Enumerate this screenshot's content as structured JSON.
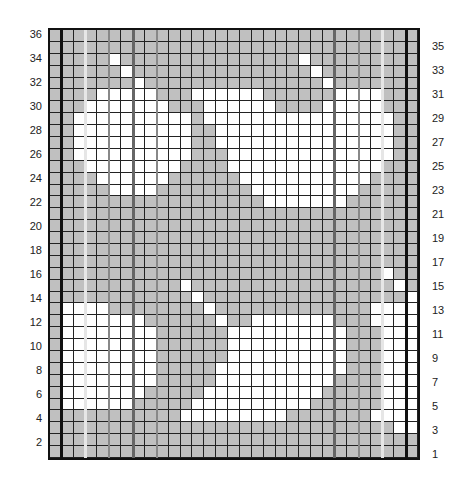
{
  "chart": {
    "rows": 36,
    "cols": 31,
    "colors": {
      "gray": "#c0c0c0",
      "white": "#ffffff",
      "grid": "#222222",
      "frame": "#111111",
      "emphasis_dark": "#555555",
      "emphasis_mid": "#888888",
      "emphasis_light": "#e0e0e0"
    },
    "left_labels": [
      "36",
      "34",
      "32",
      "30",
      "28",
      "26",
      "24",
      "22",
      "20",
      "18",
      "16",
      "14",
      "12",
      "10",
      "8",
      "6",
      "4",
      "2"
    ],
    "right_labels": [
      "35",
      "33",
      "31",
      "29",
      "27",
      "25",
      "23",
      "21",
      "19",
      "17",
      "15",
      "13",
      "11",
      "9",
      "7",
      "5",
      "3",
      "1"
    ],
    "vertical_lines": [
      {
        "col": 1,
        "color": "#111111",
        "width": 3
      },
      {
        "col": 3,
        "color": "#e6e6e6",
        "width": 3
      },
      {
        "col": 5,
        "color": "#888888",
        "width": 2
      },
      {
        "col": 7,
        "color": "#666666",
        "width": 3
      },
      {
        "col": 9,
        "color": "#888888",
        "width": 2
      },
      {
        "col": 24,
        "color": "#666666",
        "width": 3
      },
      {
        "col": 26,
        "color": "#888888",
        "width": 2
      },
      {
        "col": 28,
        "color": "#e6e6e6",
        "width": 3
      },
      {
        "col": 30,
        "color": "#111111",
        "width": 3
      }
    ]
  },
  "chart_data": {
    "type": "heatmap",
    "title": "",
    "row_labels_left": [
      36,
      34,
      32,
      30,
      28,
      26,
      24,
      22,
      20,
      18,
      16,
      14,
      12,
      10,
      8,
      6,
      4,
      2
    ],
    "row_labels_right": [
      35,
      33,
      31,
      29,
      27,
      25,
      23,
      21,
      19,
      17,
      15,
      13,
      11,
      9,
      7,
      5,
      3,
      1
    ],
    "cells": [
      "1111111111111111111111111111111",
      "1111111111111111111111111111111",
      "1111101111111111111110111111111",
      "1111110111111111111111011111111",
      "1111111011111111111111101111111",
      "1111000001110000001111110000111",
      "1110000000111000000111100000111",
      "1100000000001000000000000000011",
      "1100000000001100000000000000011",
      "1100000000001100000000000000011",
      "1100000000001110000000000000011",
      "1110000000011110000000000000111",
      "1111000000111111000000000001111",
      "1111100001111111100000000011111",
      "1111111111111111110000000111111",
      "1111111111111111111111111111111",
      "1111111111111111111111111111111",
      "1111111111111111111111111111111",
      "1111111111111111111111111111111",
      "1111111111111111111111111111111",
      "1111111111111111111111111111011",
      "1111111111101111111111111111101",
      "1111111111110111111111111111110",
      "1000011111111011111111111110000",
      "1000000011111101100000001110000",
      "1000000001111110000000000111000",
      "1000000001111110000000000111000",
      "1000000001111110000000000111000",
      "1000000001111100000000000111000",
      "1000000001111100000000001111000",
      "1000000011111000000000011111000",
      "1000000111110000000000111111000",
      "1111111111100000000011111110000",
      "1111111111111111111111111111100",
      "1111111111111111111111111111111",
      "1111111111111111111111111111111"
    ]
  }
}
